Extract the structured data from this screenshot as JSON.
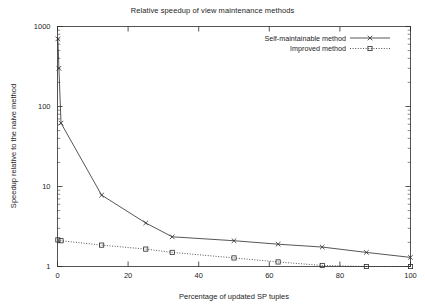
{
  "chart_data": {
    "type": "line",
    "title": "Relative speedup of view maintenance methods",
    "xlabel": "Percentage of updated SP tuples",
    "ylabel": "Speedup relative to the naive method",
    "xlim": [
      0,
      100
    ],
    "ylim": [
      1,
      1000
    ],
    "yscale": "log",
    "xscale": "linear",
    "grid": false,
    "legend_position": "top-right",
    "xticks": [
      0,
      20,
      40,
      60,
      80,
      100
    ],
    "xtick_labels": [
      "0",
      "20",
      "40",
      "60",
      "80",
      "100"
    ],
    "yticks": [
      1,
      10,
      100,
      1000
    ],
    "ytick_labels": [
      "1",
      "10",
      "100",
      "1000"
    ],
    "series": [
      {
        "name": "Self-maintainable method",
        "linestyle": "solid",
        "marker": "x",
        "color": "#2b2b2b",
        "x": [
          0.1,
          0.4,
          1.0,
          12.5,
          25.0,
          32.5,
          50.0,
          62.5,
          75.0,
          87.5,
          100.0
        ],
        "y": [
          700,
          300,
          62,
          7.8,
          3.5,
          2.35,
          2.1,
          1.9,
          1.75,
          1.5,
          1.3
        ]
      },
      {
        "name": "Improved method",
        "linestyle": "dotted",
        "marker": "square",
        "color": "#2b2b2b",
        "x": [
          0.1,
          1.0,
          12.5,
          25.0,
          32.5,
          50.0,
          62.5,
          75.0,
          87.5,
          100.0
        ],
        "y": [
          2.15,
          2.1,
          1.85,
          1.65,
          1.5,
          1.28,
          1.14,
          1.03,
          1.0,
          1.0
        ]
      }
    ]
  },
  "legend": {
    "entries": [
      {
        "label": "Self-maintainable method"
      },
      {
        "label": "Improved method"
      }
    ]
  }
}
